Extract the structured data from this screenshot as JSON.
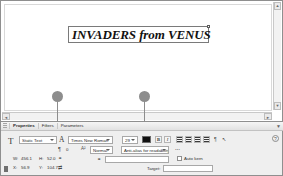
{
  "app": {
    "name": "Adobe Flash Professional",
    "stage_bg": "#ffffff"
  },
  "stage": {
    "text_object": {
      "content": "INVADERS from VENUS",
      "font": "Times New Roman",
      "style": "bold-italic",
      "selected": true
    },
    "scrollbars": {
      "v_up": "▲",
      "v_down": "▼",
      "h_left": "◄",
      "h_right": "►"
    }
  },
  "callouts": [
    {
      "id": "callout-1",
      "target": "text-type-dropdown"
    },
    {
      "id": "callout-2",
      "target": "text-color-swatch"
    }
  ],
  "panel": {
    "grip": "",
    "tabs": [
      {
        "label": "Properties",
        "active": true
      },
      {
        "label": "Filters",
        "active": false
      },
      {
        "label": "Parameters",
        "active": false
      }
    ],
    "minimize": "▼",
    "help_icon": "?",
    "tool_icon": "T",
    "char_icon": "A",
    "paragraph_icon": "¶",
    "link_icon": "⚭",
    "anchor_icon": "anchor",
    "row1": {
      "text_type": "Static Text",
      "font_family": "Times New Roman",
      "font_size": "29",
      "color_label": "Text (fill) color",
      "color_value": "#000000",
      "bold_label": "B",
      "italic_label": "I",
      "align_left": "align-left",
      "align_center": "align-center",
      "align_right": "align-right",
      "align_justify": "align-justify",
      "format_label": "¶",
      "edit_label": "↖"
    },
    "row2": {
      "letter_spacing_icon": "A|V",
      "letter_spacing": "0",
      "char_position_icon": "A²",
      "char_position": "Normal",
      "anti_alias": "Anti-alias for readability",
      "embed_label": "⋯"
    },
    "row3": {
      "link_value": "",
      "auto_kern_label": "Auto kern",
      "auto_kern_checked": false,
      "target_label": "Target:",
      "target_value": ""
    },
    "geometry": {
      "w_label": "W:",
      "w_value": "456.1",
      "h_label": "H:",
      "h_value": "52.0",
      "x_label": "X:",
      "x_value": "56.9",
      "y_label": "Y:",
      "y_value": "104.7",
      "lock_icon": "⚭",
      "swap_icon": "⇄"
    }
  }
}
